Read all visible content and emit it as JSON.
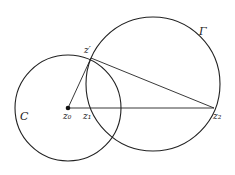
{
  "diagram": {
    "circles": [
      {
        "id": "C",
        "label": "C",
        "cx": 68,
        "cy": 108,
        "r": 53,
        "label_x": 20,
        "label_y": 120
      },
      {
        "id": "Gamma",
        "label": "Γ",
        "cx": 153,
        "cy": 84,
        "r": 67,
        "label_x": 199,
        "label_y": 35
      }
    ],
    "points": {
      "z0": {
        "label": "z₀",
        "x": 68,
        "y": 108
      },
      "z1": {
        "label": "z₁",
        "x": 88,
        "y": 108
      },
      "z2": {
        "label": "z₂",
        "x": 214,
        "y": 108
      },
      "zprime": {
        "label": "z′",
        "x": 91,
        "y": 58
      }
    },
    "segments": [
      {
        "from": "z0",
        "to": "z2"
      },
      {
        "from": "z0",
        "to": "zprime"
      },
      {
        "from": "zprime",
        "to": "z2"
      }
    ],
    "colors": {
      "stroke": "#222222",
      "background": "#ffffff"
    }
  }
}
